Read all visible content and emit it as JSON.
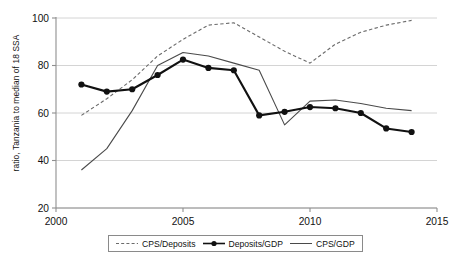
{
  "chart_data": {
    "type": "line",
    "title": "",
    "xlabel": "",
    "ylabel": "ratio, Tanzania to median of 18 SSA",
    "xlim": [
      2000,
      2015
    ],
    "ylim": [
      20,
      100
    ],
    "xticks": [
      2000,
      2005,
      2010,
      2015
    ],
    "yticks": [
      20,
      40,
      60,
      80,
      100
    ],
    "grid": "horizontal",
    "legend_position": "below-plot",
    "series": [
      {
        "name": "CPS/Deposits",
        "style": "dashed",
        "color": "#6b6b6b",
        "marker": "none",
        "x": [
          2001,
          2002,
          2003,
          2004,
          2005,
          2006,
          2007,
          2008,
          2009,
          2010,
          2011,
          2012,
          2013,
          2014
        ],
        "values": [
          59,
          66,
          74,
          84,
          91,
          97,
          98,
          92,
          86,
          81,
          89,
          94,
          97,
          99
        ]
      },
      {
        "name": "Deposits/GDP",
        "style": "solid-marker",
        "color": "#111111",
        "marker": "filled-circle",
        "x": [
          2001,
          2002,
          2003,
          2004,
          2005,
          2006,
          2007,
          2008,
          2009,
          2010,
          2011,
          2012,
          2013,
          2014
        ],
        "values": [
          72,
          69,
          70,
          76,
          82.5,
          79,
          78,
          59,
          60.5,
          62.5,
          62,
          60,
          53.5,
          52
        ]
      },
      {
        "name": "CPS/GDP",
        "style": "solid",
        "color": "#4a4a4a",
        "marker": "none",
        "x": [
          2001,
          2002,
          2003,
          2004,
          2005,
          2006,
          2007,
          2008,
          2009,
          2010,
          2011,
          2012,
          2013,
          2014
        ],
        "values": [
          36,
          45,
          61,
          80,
          85.5,
          84,
          81,
          78,
          55,
          65,
          65.5,
          64,
          62,
          61
        ]
      }
    ]
  },
  "axis": {
    "y_title": "ratio, Tanzania to median of 18 SSA",
    "xtick_labels": [
      "2000",
      "2005",
      "2010",
      "2015"
    ],
    "ytick_labels": [
      "20",
      "40",
      "60",
      "80",
      "100"
    ]
  },
  "legend": {
    "entries": [
      {
        "label": "CPS/Deposits",
        "style": "dashed"
      },
      {
        "label": "Deposits/GDP",
        "style": "marker"
      },
      {
        "label": "CPS/GDP",
        "style": "solid"
      }
    ]
  }
}
